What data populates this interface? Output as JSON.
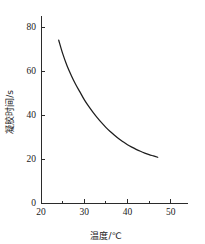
{
  "chart_data": {
    "type": "line",
    "title": "",
    "xlabel": "温度/℃",
    "ylabel": "凝胶时间/s",
    "xlim": [
      20,
      54
    ],
    "ylim": [
      0,
      85
    ],
    "xticks": [
      20,
      30,
      40,
      50
    ],
    "xtick_labels": [
      "20",
      "30",
      "40",
      "50"
    ],
    "xminorticks": [
      25,
      35,
      45
    ],
    "yticks": [
      0,
      20,
      40,
      60,
      80
    ],
    "ytick_labels": [
      "0",
      "20",
      "40",
      "60",
      "80"
    ],
    "grid": false,
    "legend": null,
    "series": [
      {
        "name": "凝胶时间",
        "x": [
          24.1,
          25.0,
          26.0,
          27.0,
          28.0,
          29.0,
          30.0,
          31.0,
          32.0,
          33.0,
          34.0,
          35.0,
          36.0,
          37.0,
          38.0,
          39.0,
          40.0,
          41.0,
          42.0,
          43.0,
          44.0,
          45.0,
          46.0,
          47.0
        ],
        "y": [
          74.0,
          68.0,
          62.5,
          58.0,
          54.0,
          50.5,
          47.0,
          44.0,
          41.3,
          38.8,
          36.5,
          34.4,
          32.5,
          30.8,
          29.2,
          27.8,
          26.5,
          25.4,
          24.4,
          23.5,
          22.7,
          22.0,
          21.4,
          20.8
        ]
      }
    ]
  },
  "axis": {
    "x_title": "温度/℃",
    "y_title": "凝胶时间/s"
  }
}
